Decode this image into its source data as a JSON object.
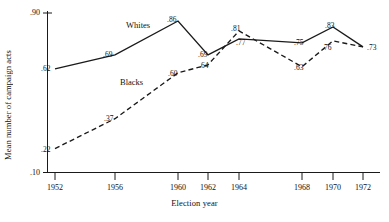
{
  "chart_data": {
    "type": "line",
    "title": "",
    "xlabel": "Election year",
    "ylabel": "Mean number of campaign acts",
    "x": [
      1952,
      1956,
      1960,
      1962,
      1964,
      1968,
      1970,
      1972
    ],
    "xtick_labels": [
      "1952",
      "1956",
      "1960",
      "1962",
      "1964",
      "1968",
      "1970",
      "1972"
    ],
    "ytick_labels": [
      ".90",
      ".10"
    ],
    "ylim": [
      0.1,
      0.9
    ],
    "grid": false,
    "legend_position": "inline-annotation",
    "series": [
      {
        "name": "Whites",
        "style": "solid",
        "color": "#111111",
        "values": [
          0.62,
          0.69,
          0.86,
          0.69,
          0.77,
          0.75,
          0.83,
          0.73
        ],
        "point_labels": [
          ".62",
          ".69",
          ".86",
          ".69",
          ".77",
          ".75",
          ".83",
          ".73"
        ]
      },
      {
        "name": "Blacks",
        "style": "dashed",
        "color": "#111111",
        "values": [
          0.22,
          0.37,
          0.6,
          0.64,
          0.81,
          0.63,
          0.76,
          0.73
        ],
        "point_labels": [
          ".22",
          ".37",
          ".60",
          ".64",
          ".81",
          ".63",
          ".76",
          ".73"
        ]
      }
    ],
    "annotations": [
      {
        "text": "Whites",
        "x": 1957.2,
        "y": 0.845
      },
      {
        "text": "Blacks",
        "x": 1957.4,
        "y": 0.565
      }
    ]
  }
}
